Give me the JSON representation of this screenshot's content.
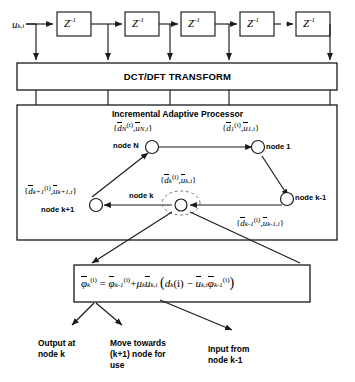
{
  "diagram": {
    "input_signal_label": "u",
    "input_signal_sub": "k,i",
    "delay_block_label": "Z",
    "delay_block_sup": "-1",
    "delay_blocks": [
      "Z-1",
      "Z-1",
      "Z-1",
      "Z-1",
      "Z-1"
    ],
    "transform_band_label": "DCT/DFT TRANSFORM",
    "processor_band_label": "Incremental Adaptive Processor",
    "ellipsis_between_taps": "dashed-link"
  },
  "nodes": [
    {
      "id": "node-N",
      "name_label": "node N",
      "pair": {
        "d_bar": "d",
        "d_sub": "N",
        "d_sup": "(i)",
        "u_bar": "u",
        "u_sub": "N,i"
      }
    },
    {
      "id": "node-1",
      "name_label": "node 1",
      "pair": {
        "d_bar": "d",
        "d_sub": "1",
        "d_sup": "(i)",
        "u_bar": "u",
        "u_sub": "1,i"
      }
    },
    {
      "id": "node-k-plus-1",
      "name_label": "node k+1",
      "pair": {
        "d_bar": "d",
        "d_sub": "k+1",
        "d_sup": "(i)",
        "u_bar": "u",
        "u_sub": "k+1,i"
      }
    },
    {
      "id": "node-k",
      "name_label": "node k",
      "pair": {
        "d_bar": "d",
        "d_sub": "k",
        "d_sup": "(i)",
        "u_bar": "u",
        "u_sub": "k,i"
      }
    },
    {
      "id": "node-k-minus-1",
      "name_label": "node k-1",
      "pair": {
        "d_bar": "d",
        "d_sub": "k-1",
        "d_sup": "(i)",
        "u_bar": "u",
        "u_sub": "k-1,i"
      }
    }
  ],
  "equation": {
    "lhs_sym": "φ",
    "lhs_sub": "k",
    "lhs_sup": "(i)",
    "eq": "=",
    "t1_sym": "φ",
    "t1_sub": "k-1",
    "t1_sup": "(i)",
    "plus": "+",
    "mu": "μ",
    "mu_sub": "k",
    "u_sym": "u",
    "u_sub": "k,i",
    "open": "(",
    "d_sym": "d",
    "d_sub": "k",
    "d_arg": "(i)",
    "minus": "−",
    "u2_sym": "u",
    "u2_sub": "k,i",
    "phi_sym": "φ",
    "phi_sub": "k-1",
    "phi_sup": "(i)",
    "close": ")"
  },
  "captions": [
    {
      "id": "caption-output",
      "line1": "Output at",
      "line2": "node k",
      "line3": ""
    },
    {
      "id": "caption-move",
      "line1": "Move towards",
      "line2": "(k+1)  node for",
      "line3": "use"
    },
    {
      "id": "caption-input",
      "line1": "Input from",
      "line2": "node k-1",
      "line3": ""
    }
  ],
  "colors": {
    "stroke": "#1a1a1a",
    "fill": "#ffffff",
    "text": "#000000"
  }
}
